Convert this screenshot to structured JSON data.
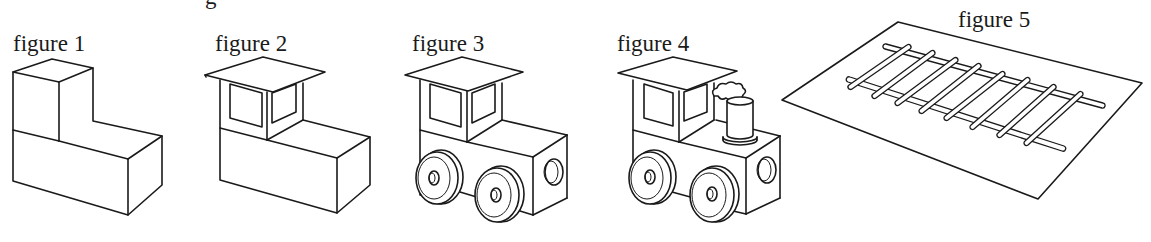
{
  "document": {
    "cropped_heading_fragment": "g",
    "figures": [
      {
        "id": 1,
        "label": "figure 1",
        "depicts": "L-shaped block made of a cube on top of a rectangular box"
      },
      {
        "id": 2,
        "label": "figure 2",
        "depicts": "Block with a cab: windows cut in the upper cube and a flat roof"
      },
      {
        "id": 3,
        "label": "figure 3",
        "depicts": "Cab block with wheels added and a side hub"
      },
      {
        "id": 4,
        "label": "figure 4",
        "depicts": "Toy locomotive with smokestack and puff of smoke"
      },
      {
        "id": 5,
        "label": "figure 5",
        "depicts": "Railroad track with two rails and eight crossties on a flat sheet"
      }
    ]
  },
  "colors": {
    "ink": "#1a1a1a",
    "paper": "#ffffff"
  },
  "track": {
    "rail_count": 2,
    "tie_count": 8
  }
}
